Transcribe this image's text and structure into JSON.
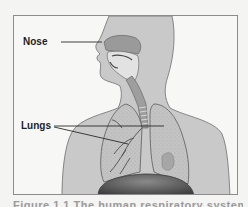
{
  "figure": {
    "labels": {
      "nose": "Nose",
      "lungs": "Lungs"
    },
    "caption_partial": "Figure 1.1 The human respiratory system",
    "colors": {
      "background": "#f4f4f2",
      "frame_border": "#8c8c8c",
      "body_fill": "#c8c8c8",
      "body_outline": "#6e6e6e",
      "lung_fill": "#bdbdbd",
      "diaphragm_fill": "#5a5a5a",
      "label_text": "#1e1e1e",
      "leader_line": "#2a2a2a"
    }
  }
}
